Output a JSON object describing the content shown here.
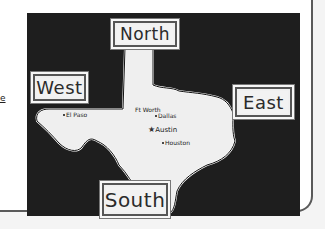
{
  "card": {
    "partial_left_text": "e"
  },
  "map": {
    "title": "Texas",
    "directions": {
      "north": "North",
      "west": "West",
      "east": "East",
      "south": "South"
    },
    "cities": [
      {
        "name": "El Paso",
        "marker": "dot"
      },
      {
        "name": "Ft Worth",
        "marker": "dot"
      },
      {
        "name": "Dallas",
        "marker": "dot"
      },
      {
        "name": "Austin",
        "marker": "star"
      },
      {
        "name": "Houston",
        "marker": "dot"
      }
    ],
    "colors": {
      "board": "#1e1e1e",
      "state_fill": "#efefef",
      "label_bg": "#f2f2f2"
    }
  }
}
